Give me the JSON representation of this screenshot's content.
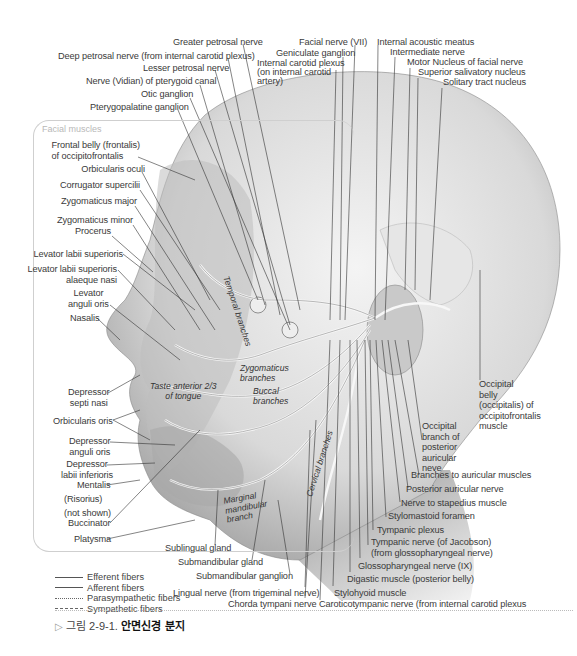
{
  "figure": {
    "caption_prefix": "그림 2-9-1.",
    "caption_title": "안면신경 분지",
    "caption_icon": "triangle-right-outline"
  },
  "muscle_box": {
    "title": "Facial muscles",
    "labels": [
      "Frontal belly (frontalis)",
      "of occipitofrontalis",
      "Orbicularis oculi",
      "Corrugator supercilii",
      "Zygomaticus major",
      "Zygomaticus minor",
      "Procerus",
      "Levator labii superioris",
      "Levator labii superioris",
      "alaeque nasi",
      "Levator",
      "anguli oris",
      "Nasalis",
      "Depressor",
      "septi nasi",
      "Orbicularis oris",
      "Depressor",
      "anguli oris",
      "Depressor",
      "labii inferioris",
      "Mentalis",
      "(Risorius)",
      "(not shown)",
      "Buccinator",
      "Platysma"
    ]
  },
  "top_labels": {
    "greater_petrosal": "Greater petrosal nerve",
    "deep_petrosal": "Deep petrosal nerve (from internal carotid plexus)",
    "lesser_petrosal": "Lesser petrosal nerve",
    "vidian": "Nerve (Vidian) of pterygoid canal",
    "otic": "Otic ganglion",
    "pterygopalatine": "Pterygopalatine ganglion",
    "facial_nerve": "Facial nerve (VII)",
    "geniculate": "Geniculate ganglion",
    "ica_plexus_1": "Internal carotid plexus",
    "ica_plexus_2": "(on internal carotid",
    "ica_plexus_3": "artery)",
    "iam": "Internal acoustic meatus",
    "intermediate": "Intermediate nerve",
    "motor_nucleus": "Motor Nucleus of facial nerve",
    "sup_salivatory": "Superior salivatory nucleus",
    "solitary": "Solitary tract nucleus"
  },
  "right_labels": {
    "occ_belly": [
      "Occipital",
      "belly",
      "(occipitalis) of",
      "occipitofrontalis",
      "muscle"
    ],
    "occ_branch": [
      "Occipital",
      "branch of",
      "posterior",
      "auricular",
      "neve"
    ],
    "branches_auricular": "Branches to auricular muscles",
    "post_auricular": "Posterior auricular nerve",
    "stapedius": "Nerve to stapedius muscle",
    "stylomastoid": "Stylomastoid foramen",
    "tympanic_plexus": "Tympanic plexus",
    "tympanic_nerve_1": "Tympanic nerve (of Jacobson)",
    "tympanic_nerve_2": "(from glossopharyngeal nerve)",
    "glossopharyngeal": "Glossopharyngeal nerve (IX)",
    "digastric": "Digastic muscle (posterior belly)",
    "stylohyoid": "Stylohyoid muscle",
    "caroticotympanic": "Caroticotympanic nerve (from internal carotid plexus"
  },
  "bottom_labels": {
    "sublingual": "Sublingual gland",
    "submandibular_gland": "Submandibular gland",
    "submandibular_ganglion": "Submandibular ganglion",
    "lingual": "Lingual nerve (from trigeminal nerve)",
    "chorda": "Chorda tympani nerve"
  },
  "inner_labels": {
    "temporal": "Temporal branches",
    "zygomatic_1": "Zygomaticus",
    "zygomatic_2": "branches",
    "buccal_1": "Buccal",
    "buccal_2": "branches",
    "taste_1": "Taste anterior 2/3",
    "taste_2": "of tongue",
    "marginal_1": "Marginal",
    "marginal_2": "mandibular",
    "marginal_3": "branch",
    "cervical": "Cervical branches"
  },
  "legend": [
    {
      "style": "solid",
      "label": "Efferent fibers"
    },
    {
      "style": "solid",
      "label": "Afferent fibers"
    },
    {
      "style": "dotted",
      "label": "Parasympathetic fibers"
    },
    {
      "style": "dashed",
      "label": "Sympathetic fibers"
    }
  ]
}
